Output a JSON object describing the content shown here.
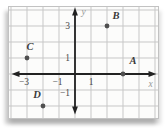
{
  "colors": {
    "page_background": "#ffffff",
    "plot_background": "#fcfcfb",
    "grid": "#c7c7c7",
    "plot_border": "#c2c2c2",
    "axis": "#222222",
    "point": "#4f4f4f",
    "point_label": "#3a3a3a",
    "tick_label": "#4a4a4a",
    "axis_letter": "#979797"
  },
  "chart_data": {
    "type": "scatter",
    "title": "",
    "xlabel": "x",
    "ylabel": "y",
    "xlim": [
      -4.2,
      5.2
    ],
    "ylim": [
      -2.9,
      4.2
    ],
    "grid": true,
    "grid_x_range": [
      -4,
      5
    ],
    "grid_y_range": [
      -2,
      4
    ],
    "x_ticks": [
      {
        "value": -3,
        "label": "−3",
        "dx": -3
      },
      {
        "value": -1,
        "label": "−1",
        "dx": -1.5
      },
      {
        "value": 1,
        "label": "1",
        "dx": 0
      }
    ],
    "y_ticks": [
      {
        "value": 3,
        "label": "3",
        "dy": 2.5
      },
      {
        "value": 1,
        "label": "1",
        "dy": 2.5
      },
      {
        "value": -1,
        "label": "−1",
        "dy": 6
      }
    ],
    "points": [
      {
        "label": "A",
        "x": 3,
        "y": 0,
        "label_dx": 10,
        "label_dy": -12
      },
      {
        "label": "B",
        "x": 2,
        "y": 3,
        "label_dx": 9,
        "label_dy": -9
      },
      {
        "label": "C",
        "x": -3,
        "y": 1,
        "label_dx": 3,
        "label_dy": -10
      },
      {
        "label": "D",
        "x": -2,
        "y": -2,
        "label_dx": -6,
        "label_dy": -10
      }
    ]
  }
}
